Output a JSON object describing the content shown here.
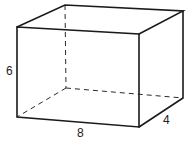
{
  "figure": {
    "type": "rectangular-prism",
    "labels": {
      "height": "6",
      "length": "8",
      "depth": "4"
    },
    "colors": {
      "stroke": "#1a1a1a",
      "background": "#ffffff"
    }
  }
}
